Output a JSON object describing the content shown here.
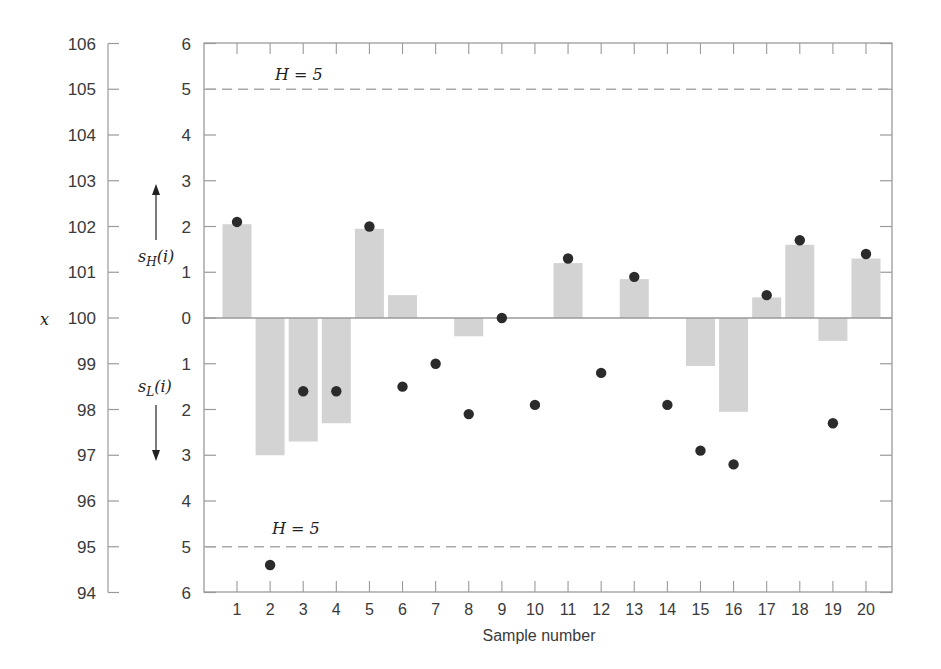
{
  "chart_data": {
    "type": "bar",
    "title": "",
    "xlabel": "Sample number",
    "ylabel": "x",
    "categories": [
      1,
      2,
      3,
      4,
      5,
      6,
      7,
      8,
      9,
      10,
      11,
      12,
      13,
      14,
      15,
      16,
      17,
      18,
      19,
      20
    ],
    "series": [
      {
        "name": "CUSUM s_H(i) (up) / s_L(i) (down, shown negative)",
        "kind": "bar",
        "values": [
          2.05,
          -3.0,
          -2.7,
          -2.3,
          1.95,
          0.5,
          0,
          -0.4,
          0,
          0,
          1.2,
          0,
          0.85,
          0,
          -1.05,
          -2.05,
          0.45,
          1.6,
          -0.5,
          1.3
        ]
      },
      {
        "name": "x (observations)",
        "kind": "scatter",
        "values": [
          102.1,
          94.6,
          98.4,
          98.4,
          102.0,
          98.5,
          99.0,
          97.9,
          100.0,
          98.1,
          101.3,
          98.8,
          100.9,
          98.1,
          97.1,
          96.8,
          100.5,
          101.7,
          97.7,
          101.4
        ]
      }
    ],
    "left_axis": {
      "label": "x",
      "ticks": [
        106,
        105,
        104,
        103,
        102,
        101,
        100,
        99,
        98,
        97,
        96,
        95,
        94
      ],
      "range": [
        94,
        106
      ]
    },
    "inner_axis": {
      "ticks": [
        "6",
        "5",
        "4",
        "3",
        "2",
        "1",
        "0",
        "1",
        "2",
        "3",
        "4",
        "5",
        "6"
      ],
      "upper_label": "s_H(i)",
      "lower_label": "s_L(i)",
      "range": [
        -6,
        6
      ]
    },
    "reference_lines": [
      {
        "label": "H = 5",
        "value": 5,
        "style": "dashed"
      },
      {
        "label": "H = 5",
        "value": -5,
        "style": "dashed"
      }
    ],
    "grid": false,
    "legend": null
  },
  "labels": {
    "x_axis_title": "Sample number",
    "left_axis_title": "x",
    "upper_arrow_label_main": "s",
    "upper_arrow_label_sub": "H",
    "upper_arrow_label_tail": "(i)",
    "lower_arrow_label_main": "s",
    "lower_arrow_label_sub": "L",
    "lower_arrow_label_tail": "(i)",
    "h_upper": "H = 5",
    "h_lower": "H = 5"
  },
  "colors": {
    "bar": "#d3d3d3",
    "point": "#2b2b2b",
    "axis": "#9a9a9a",
    "dashed": "#a8a8a8"
  }
}
